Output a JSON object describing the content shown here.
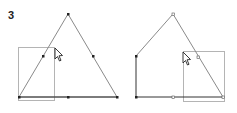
{
  "step_label": "3",
  "colors": {
    "shape_stroke": "#8a8a8a",
    "selection_stroke": "#b4b4b4",
    "vertex_fill": "#222222",
    "cursor_fill": "#ffffff",
    "cursor_stroke": "#222222"
  },
  "panels": [
    {
      "name": "before",
      "shape": "triangle",
      "vertices": [
        [
          68,
          14
        ],
        [
          19,
          97
        ],
        [
          117,
          97
        ]
      ],
      "vertex_handles": [
        [
          68,
          14
        ],
        [
          19,
          97
        ],
        [
          117,
          97
        ],
        [
          43,
          56
        ],
        [
          93,
          56
        ],
        [
          68,
          97
        ]
      ],
      "selection_rect": {
        "x": 18,
        "y": 47,
        "w": 36,
        "h": 53
      },
      "cursor": [
        55,
        48
      ]
    },
    {
      "name": "after",
      "shape": "pentagon",
      "vertices": [
        [
          173,
          14
        ],
        [
          136,
          56
        ],
        [
          136,
          97
        ],
        [
          223,
          97
        ]
      ],
      "vertex_handles": [
        [
          173,
          14
        ],
        [
          136,
          56
        ],
        [
          136,
          97
        ],
        [
          173,
          97
        ],
        [
          198,
          57
        ],
        [
          223,
          97
        ]
      ],
      "selection_rect": {
        "x": 183,
        "y": 51,
        "w": 41,
        "h": 50
      },
      "cursor": [
        183,
        52
      ]
    }
  ]
}
